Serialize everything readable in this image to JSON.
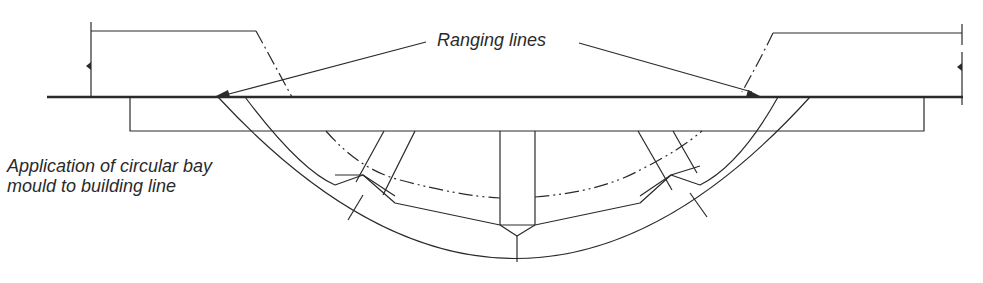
{
  "figure": {
    "labels": {
      "ranging_lines": "Ranging lines",
      "application_line1": "Application of circular bay",
      "application_line2": "mould to building line"
    },
    "colors": {
      "line": "#2a2a2a",
      "background": "#ffffff"
    },
    "elements": [
      "building-line",
      "left-wall",
      "right-wall",
      "mould-board",
      "outer-arc-rib",
      "inner-arc-rib",
      "centre-struts",
      "diagonal-struts",
      "bay-curve-dash-dot",
      "ranging-line-arrows"
    ]
  }
}
